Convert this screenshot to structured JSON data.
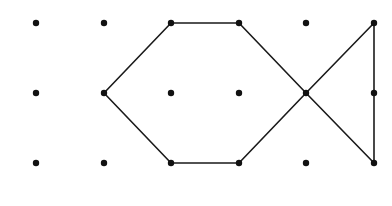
{
  "diagram": {
    "grid": {
      "columns_x": [
        36,
        104,
        171,
        239,
        306,
        374
      ],
      "rows_y": [
        23,
        93,
        163
      ],
      "dot_radius": 3.2,
      "dot_color": "#111111"
    },
    "segments": [
      {
        "from": [
          1,
          1
        ],
        "to": [
          2,
          0
        ]
      },
      {
        "from": [
          2,
          0
        ],
        "to": [
          3,
          0
        ]
      },
      {
        "from": [
          3,
          0
        ],
        "to": [
          4,
          1
        ]
      },
      {
        "from": [
          1,
          1
        ],
        "to": [
          2,
          2
        ]
      },
      {
        "from": [
          2,
          2
        ],
        "to": [
          3,
          2
        ]
      },
      {
        "from": [
          3,
          2
        ],
        "to": [
          4,
          1
        ]
      },
      {
        "from": [
          4,
          1
        ],
        "to": [
          5,
          0
        ]
      },
      {
        "from": [
          4,
          1
        ],
        "to": [
          5,
          2
        ]
      },
      {
        "from": [
          5,
          0
        ],
        "to": [
          5,
          2
        ]
      }
    ],
    "line_color": "#1a1a1a",
    "line_width": 1.6
  }
}
